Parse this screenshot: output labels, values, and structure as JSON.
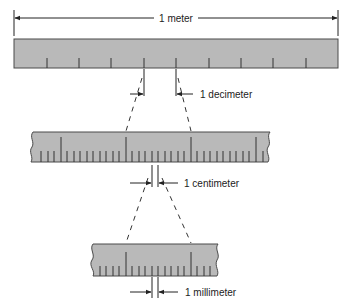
{
  "colors": {
    "ruler_fill": "#b9b9b9",
    "ruler_edge": "#4a4a4a",
    "line": "#222222",
    "background": "#ffffff"
  },
  "labels": {
    "meter": "1 meter",
    "decimeter": "1 decimeter",
    "centimeter": "1 centimeter",
    "millimeter": "1 millimeter"
  },
  "rulers": [
    {
      "name": "meter-ruler",
      "divisions": 10,
      "unit": "decimeter"
    },
    {
      "name": "decimeter-ruler",
      "divisions": "centimeter marks with millimeter subdivisions",
      "unit": "centimeter"
    },
    {
      "name": "centimeter-ruler",
      "divisions": "millimeter marks",
      "unit": "millimeter"
    }
  ]
}
